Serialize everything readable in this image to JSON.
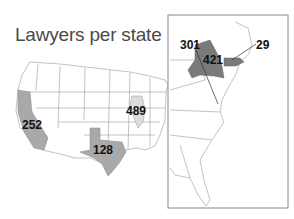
{
  "title": "Lawyers per state",
  "map": {
    "type": "choropleth-us-states",
    "inset": "Northeast / East coast zoom",
    "colors": {
      "light": "#dcdcdc",
      "medium": "#a9a9a9",
      "dark": "#7a7a7a",
      "outline": "#9a9a9a",
      "frame": "#888888"
    },
    "labels": [
      {
        "state": "California",
        "value": "252",
        "shade": "medium"
      },
      {
        "state": "Texas",
        "value": "128",
        "shade": "medium"
      },
      {
        "state": "Illinois",
        "value": "489",
        "shade": "light"
      },
      {
        "state": "New York",
        "value": "421",
        "shade": "dark"
      },
      {
        "state": "Washington DC / Maryland area",
        "value": "301",
        "shade": "none"
      },
      {
        "state": "Massachusetts",
        "value": "29",
        "shade": "dark"
      }
    ]
  }
}
